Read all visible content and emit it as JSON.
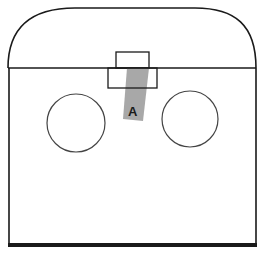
{
  "diagram": {
    "label_a": "A",
    "colors": {
      "stroke": "#1a1a1a",
      "strip": "#a8a8a8",
      "background": "#ffffff"
    }
  }
}
